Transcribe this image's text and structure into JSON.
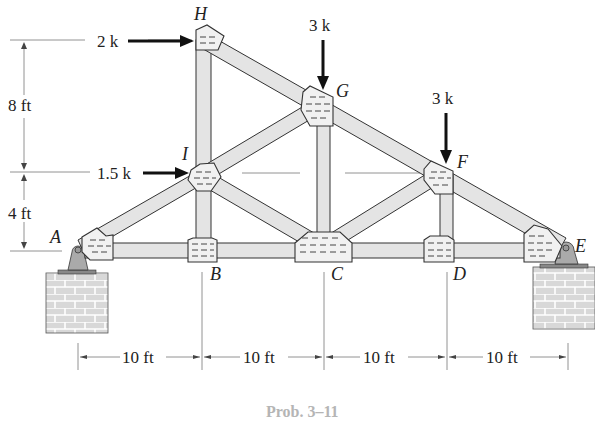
{
  "figure": {
    "caption": "Prob. 3–11",
    "type": "roof truss with pin supports"
  },
  "nodes": {
    "A": "A",
    "B": "B",
    "C": "C",
    "D": "D",
    "E": "E",
    "F": "F",
    "G": "G",
    "H": "H",
    "I": "I"
  },
  "loads": {
    "H_horizontal": "2 k",
    "I_horizontal": "1.5 k",
    "G_vertical": "3 k",
    "F_vertical": "3 k"
  },
  "dimensions": {
    "vertical_upper": "8 ft",
    "vertical_lower": "4 ft",
    "span_AB": "10 ft",
    "span_BC": "10 ft",
    "span_CD": "10 ft",
    "span_DE": "10 ft"
  },
  "colors": {
    "member_fill": "#e4e4e4",
    "gusset_fill": "#f1f1f1",
    "outline": "#333333",
    "caption": "#b5b5b5"
  }
}
